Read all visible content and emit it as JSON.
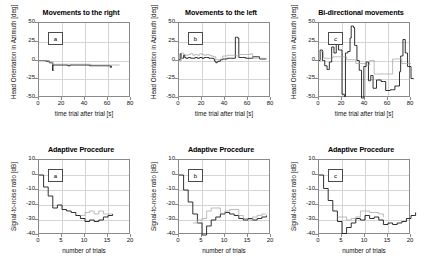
{
  "figure": {
    "rows": 2,
    "cols": 3,
    "background": "#ffffff",
    "trace_colors": {
      "primary": "#1a1a1a",
      "secondary": "#a0a0a0",
      "grid": "#d4d4d4",
      "axis": "#8a8a8a"
    }
  },
  "chart_data": [
    {
      "id": "top-a",
      "type": "line",
      "title": "Movements to the right",
      "panel_letter": "a",
      "xlabel": "time trial after trial [s]",
      "ylabel": "Head Orientation in Azimuth [deg]",
      "xlim": [
        0,
        80
      ],
      "ylim": [
        -50,
        50
      ],
      "xticks": [
        0,
        20,
        40,
        60,
        80
      ],
      "yticks": [
        -50,
        -25,
        0,
        25,
        50
      ],
      "grid": true,
      "series": [
        {
          "name": "head-orientation-black",
          "color": "#1a1a1a",
          "x": [
            0,
            2,
            6,
            8,
            9,
            9,
            12,
            12,
            25,
            25,
            27,
            27,
            44,
            44,
            62,
            62,
            63
          ],
          "y": [
            0,
            0,
            -1,
            -1,
            -3,
            -3,
            -14,
            -6,
            -6,
            -7,
            -7,
            -6,
            -6,
            -7,
            -7,
            -9,
            -7
          ]
        },
        {
          "name": "head-orientation-gray",
          "color": "#a0a0a0",
          "x": [
            0,
            9,
            12,
            13,
            26,
            27,
            44,
            45,
            62,
            70
          ],
          "y": [
            0,
            -2,
            -5,
            -5,
            -5,
            -5,
            -5,
            -6,
            -6,
            -6
          ]
        }
      ]
    },
    {
      "id": "top-b",
      "type": "line",
      "title": "Movements to the left",
      "panel_letter": "b",
      "xlabel": "time trial after trial [s]",
      "ylabel": "Head Orientation in Azimuth [deg]",
      "xlim": [
        0,
        80
      ],
      "ylim": [
        -50,
        50
      ],
      "xticks": [
        0,
        20,
        40,
        60,
        80
      ],
      "yticks": [
        -50,
        -25,
        0,
        25,
        50
      ],
      "grid": true,
      "series": [
        {
          "name": "head-orientation-black",
          "color": "#1a1a1a",
          "x": [
            0,
            1,
            2,
            3,
            4,
            5,
            6,
            8,
            10,
            12,
            14,
            16,
            18,
            20,
            22,
            24,
            26,
            28,
            30,
            31,
            32,
            33,
            34,
            36,
            38,
            40,
            42,
            44,
            46,
            48,
            49,
            50,
            51,
            52,
            53,
            55,
            58,
            60,
            62,
            64,
            66,
            68,
            70,
            73,
            76
          ],
          "y": [
            1,
            9,
            3,
            3,
            7,
            4,
            3,
            4,
            3,
            3,
            4,
            3,
            4,
            3,
            4,
            4,
            3,
            3,
            2,
            -1,
            -3,
            -2,
            -1,
            1,
            2,
            2,
            3,
            3,
            3,
            3,
            31,
            31,
            30,
            4,
            4,
            4,
            3,
            3,
            3,
            5,
            5,
            5,
            2,
            2,
            2
          ]
        },
        {
          "name": "head-orientation-gray",
          "color": "#a0a0a0",
          "x": [
            0,
            2,
            4,
            6,
            8,
            10,
            12,
            14,
            16,
            18,
            20,
            22,
            24,
            26,
            28,
            30,
            32,
            34,
            36,
            38,
            40,
            42,
            44,
            46,
            48,
            50,
            52,
            54,
            56,
            58,
            60,
            62,
            64,
            66,
            68,
            72,
            76
          ],
          "y": [
            0,
            10,
            8,
            7,
            8,
            9,
            7,
            8,
            7,
            9,
            8,
            7,
            8,
            7,
            6,
            5,
            1,
            1,
            2,
            6,
            6,
            7,
            7,
            7,
            7,
            6,
            8,
            8,
            8,
            8,
            8,
            9,
            3,
            3,
            3,
            3,
            3
          ]
        }
      ]
    },
    {
      "id": "top-c",
      "type": "line",
      "title": "Bi-directional movements",
      "panel_letter": "c",
      "xlabel": "time trial after trial [s]",
      "ylabel": "Head Orientation in Azimuth [deg]",
      "xlim": [
        0,
        80
      ],
      "ylim": [
        -50,
        50
      ],
      "xticks": [
        0,
        20,
        40,
        60,
        80
      ],
      "yticks": [
        -50,
        -25,
        0,
        25,
        50
      ],
      "grid": true,
      "series": [
        {
          "name": "head-orientation-black",
          "color": "#1a1a1a",
          "x": [
            0,
            1,
            2,
            3,
            4,
            5,
            6,
            7,
            8,
            9,
            10,
            11,
            12,
            13,
            14,
            15,
            16,
            17,
            18,
            19,
            20,
            21,
            22,
            23,
            24,
            25,
            26,
            27,
            28,
            29,
            30,
            31,
            32,
            33,
            34,
            35,
            36,
            37,
            38,
            39,
            40,
            41,
            42,
            43,
            44,
            45,
            46,
            47,
            48,
            50,
            52,
            54,
            56,
            58,
            60,
            62,
            64,
            66,
            68,
            70,
            71,
            72,
            73,
            74,
            75,
            76,
            77,
            78,
            80,
            82
          ],
          "y": [
            0,
            14,
            14,
            0,
            0,
            -7,
            -7,
            -12,
            -12,
            -2,
            -2,
            18,
            18,
            10,
            10,
            22,
            22,
            14,
            14,
            14,
            -45,
            -45,
            -48,
            10,
            10,
            12,
            12,
            30,
            46,
            46,
            44,
            20,
            20,
            0,
            0,
            -13,
            -13,
            -50,
            -50,
            -8,
            -8,
            -2,
            -2,
            -27,
            -27,
            -20,
            -20,
            -37,
            -37,
            -26,
            -26,
            -28,
            -28,
            -40,
            -40,
            -39,
            -39,
            -34,
            -34,
            -15,
            6,
            6,
            28,
            28,
            10,
            10,
            -8,
            -8,
            -24,
            -25
          ]
        },
        {
          "name": "head-orientation-gray",
          "color": "#a0a0a0",
          "x": [
            0,
            2,
            4,
            6,
            8,
            10,
            12,
            14,
            16,
            18,
            20,
            22,
            24,
            26,
            28,
            30,
            32,
            34,
            36,
            38,
            40,
            42,
            44,
            46,
            48,
            50,
            52,
            54,
            56,
            58,
            60,
            62,
            64,
            66,
            68,
            70,
            72,
            74,
            76,
            78,
            80
          ],
          "y": [
            12,
            12,
            3,
            3,
            3,
            3,
            5,
            5,
            5,
            5,
            5,
            5,
            1,
            1,
            1,
            1,
            -4,
            -4,
            -4,
            -4,
            -6,
            -6,
            0,
            0,
            -18,
            -18,
            -18,
            -18,
            -18,
            -18,
            -18,
            -18,
            2,
            2,
            2,
            2,
            -4,
            -4,
            -4,
            -4,
            -4
          ]
        }
      ]
    },
    {
      "id": "bottom-a",
      "type": "line",
      "title": "Adaptive Procedure",
      "panel_letter": "a",
      "xlabel": "number of trials",
      "ylabel": "Signal-to-noise ratio [dB]",
      "xlim": [
        0,
        20
      ],
      "ylim": [
        -40,
        10
      ],
      "xticks": [
        0,
        5,
        10,
        15,
        20
      ],
      "yticks": [
        -40,
        -30,
        -20,
        -10,
        0,
        10
      ],
      "grid": true,
      "series": [
        {
          "name": "snr-black",
          "color": "#1a1a1a",
          "x": [
            0,
            1,
            2,
            3,
            4,
            5,
            6,
            7,
            8,
            9,
            10,
            11,
            12,
            13,
            14,
            15,
            16
          ],
          "y": [
            0,
            -8,
            -14,
            -22,
            -20,
            -23,
            -24,
            -25,
            -27,
            -29,
            -31,
            -30,
            -31,
            -30,
            -28,
            -27,
            -26
          ]
        },
        {
          "name": "snr-gray",
          "color": "#a0a0a0",
          "x": [
            9,
            10,
            11,
            12,
            13,
            14,
            15,
            16
          ],
          "y": [
            -27,
            -25,
            -24,
            -26,
            -24,
            -26,
            -26,
            -26
          ]
        }
      ]
    },
    {
      "id": "bottom-b",
      "type": "line",
      "title": "Adaptive Procedure",
      "panel_letter": "b",
      "xlabel": "number of trials",
      "ylabel": "Signal-to-noise ratio [dB]",
      "xlim": [
        0,
        20
      ],
      "ylim": [
        -40,
        10
      ],
      "xticks": [
        0,
        5,
        10,
        15,
        20
      ],
      "yticks": [
        -40,
        -30,
        -20,
        -10,
        0,
        10
      ],
      "grid": true,
      "series": [
        {
          "name": "snr-black",
          "color": "#1a1a1a",
          "x": [
            0,
            1,
            2,
            3,
            4,
            5,
            6,
            7,
            8,
            9,
            10,
            11,
            12,
            13,
            14,
            15,
            16,
            17,
            18,
            19
          ],
          "y": [
            0,
            -10,
            -18,
            -26,
            -32,
            -40,
            -34,
            -30,
            -28,
            -26,
            -25,
            -26,
            -27,
            -29,
            -30,
            -29,
            -30,
            -29,
            -28,
            -27
          ]
        },
        {
          "name": "snr-gray",
          "color": "#a0a0a0",
          "x": [
            3,
            4,
            5,
            6,
            7,
            8,
            9,
            10,
            11,
            12,
            13,
            14,
            15,
            16,
            17,
            18,
            19
          ],
          "y": [
            -32,
            -30,
            -29,
            -24,
            -22,
            -22,
            -26,
            -24,
            -23,
            -23,
            -27,
            -29,
            -30,
            -28,
            -27,
            -26,
            -26
          ]
        }
      ]
    },
    {
      "id": "bottom-c",
      "type": "line",
      "title": "Adaptive Procedure",
      "panel_letter": "c",
      "xlabel": "number of trials",
      "ylabel": "Signal-to-noise ratio [dB]",
      "xlim": [
        0,
        20
      ],
      "ylim": [
        -40,
        10
      ],
      "xticks": [
        0,
        5,
        10,
        15,
        20
      ],
      "yticks": [
        -40,
        -30,
        -20,
        -10,
        0,
        10
      ],
      "grid": true,
      "series": [
        {
          "name": "snr-black",
          "color": "#1a1a1a",
          "x": [
            0,
            1,
            2,
            3,
            4,
            5,
            6,
            7,
            8,
            9,
            10,
            11,
            12,
            13,
            14,
            15,
            16,
            17,
            18,
            19,
            20,
            21
          ],
          "y": [
            0,
            -9,
            -17,
            -24,
            -31,
            -39,
            -35,
            -32,
            -29,
            -30,
            -27,
            -29,
            -28,
            -30,
            -33,
            -32,
            -33,
            -32,
            -31,
            -29,
            -27,
            -25
          ]
        },
        {
          "name": "snr-gray",
          "color": "#a0a0a0",
          "x": [
            4,
            5,
            6,
            7,
            8,
            9,
            10,
            11,
            12,
            13,
            14
          ],
          "y": [
            -28,
            -28,
            -30,
            -29,
            -28,
            -24,
            -24,
            -25,
            -25,
            -26,
            -28
          ]
        }
      ]
    }
  ]
}
